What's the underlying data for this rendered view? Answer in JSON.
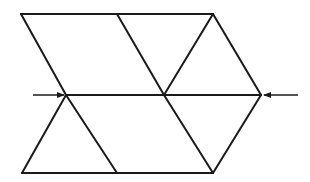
{
  "diagram": {
    "stroke_color": "#1a1a1a",
    "stroke_width": 2,
    "segments": [
      {
        "id": "top-edge",
        "x1": 21,
        "y1": 14,
        "x2": 213,
        "y2": 14
      },
      {
        "id": "upper-left-diagonal",
        "x1": 21,
        "y1": 14,
        "x2": 66,
        "y2": 95
      },
      {
        "id": "upper-middle-diagonal",
        "x1": 117,
        "y1": 14,
        "x2": 164,
        "y2": 95
      },
      {
        "id": "upper-inner-right-diagonal",
        "x1": 213,
        "y1": 14,
        "x2": 164,
        "y2": 95
      },
      {
        "id": "upper-outer-right-diagonal",
        "x1": 213,
        "y1": 14,
        "x2": 261,
        "y2": 95
      },
      {
        "id": "middle-edge",
        "x1": 66,
        "y1": 95,
        "x2": 261,
        "y2": 95
      },
      {
        "id": "lower-left-diagonal",
        "x1": 66,
        "y1": 95,
        "x2": 22,
        "y2": 173
      },
      {
        "id": "lower-left-inner-diagonal",
        "x1": 66,
        "y1": 95,
        "x2": 117,
        "y2": 173
      },
      {
        "id": "lower-middle-diagonal",
        "x1": 164,
        "y1": 95,
        "x2": 213,
        "y2": 173
      },
      {
        "id": "lower-right-diagonal",
        "x1": 261,
        "y1": 95,
        "x2": 213,
        "y2": 173
      },
      {
        "id": "bottom-edge",
        "x1": 22,
        "y1": 173,
        "x2": 213,
        "y2": 173
      }
    ],
    "arrows": [
      {
        "id": "left-arrow",
        "x1": 33,
        "y1": 95,
        "x2": 64,
        "y2": 95,
        "direction": "right"
      },
      {
        "id": "right-arrow",
        "x1": 298,
        "y1": 95,
        "x2": 264,
        "y2": 95,
        "direction": "left"
      }
    ]
  }
}
